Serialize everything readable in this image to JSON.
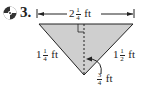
{
  "problem": {
    "number": "3.",
    "icon": "cd-icon"
  },
  "figure": {
    "shape": "triangle",
    "fill_color": "#cfcfcf",
    "stroke_color": "#222222",
    "top_base": {
      "whole": "2",
      "num": "1",
      "den": "4",
      "unit": "ft"
    },
    "left_side": {
      "whole": "1",
      "num": "1",
      "den": "4",
      "unit": "ft"
    },
    "right_side": {
      "whole": "1",
      "num": "1",
      "den": "2",
      "unit": "ft"
    },
    "height": {
      "whole": "",
      "num": "3",
      "den": "4",
      "unit": "ft"
    },
    "right_angle_marker": true,
    "altitude": "dashed"
  }
}
